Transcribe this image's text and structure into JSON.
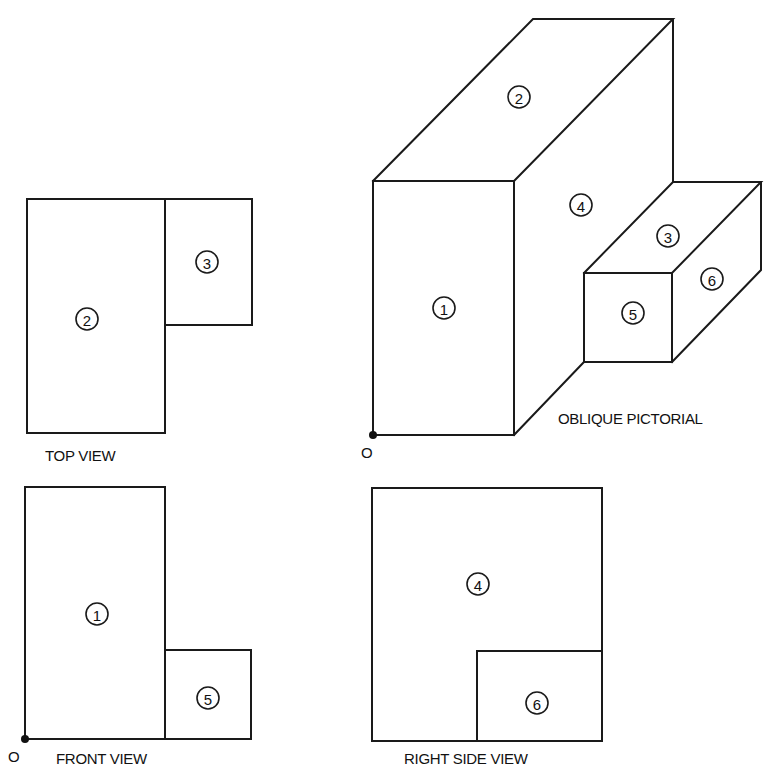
{
  "figure": {
    "views": {
      "top": {
        "caption": "TOP VIEW",
        "faces": [
          "2",
          "3"
        ]
      },
      "oblique": {
        "caption": "OBLIQUE PICTORIAL",
        "origin": "O",
        "faces": [
          "1",
          "2",
          "3",
          "4",
          "5",
          "6"
        ]
      },
      "front": {
        "caption": "FRONT VIEW",
        "origin": "O",
        "faces": [
          "1",
          "5"
        ]
      },
      "right": {
        "caption": "RIGHT SIDE VIEW",
        "faces": [
          "4",
          "6"
        ]
      }
    },
    "colors": {
      "line": "#1a1a1a",
      "background": "#ffffff"
    }
  }
}
